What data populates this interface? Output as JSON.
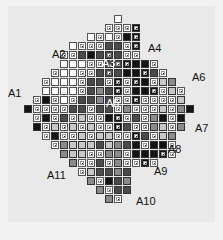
{
  "figure": {
    "background": "#e9e9e9",
    "cell_pitch": 9,
    "origin": {
      "x": 15,
      "y": 15
    },
    "colors": {
      "W": "#ffffff",
      "L": "#c8c8c8",
      "G": "#8a8a8a",
      "D": "#4a4a4a",
      "K": "#141414"
    },
    "legend_codes": {
      ".": "empty",
      "W": "white",
      "w": "white-with-marker",
      "L": "light-gray",
      "l": "light-gray-with-marker",
      "G": "gray",
      "g": "gray-with-marker",
      "D": "dark-gray",
      "d": "dark-gray-with-marker",
      "K": "black",
      "k": "black-with-marker"
    },
    "rows": [
      "...........W..........",
      "..........wwwk........",
      "........WwWwKk........",
      "......WwwwDDwk........",
      ".....wwDKDdDww........",
      ".....WWWwwDdkKKw......",
      "....wWWwwDdDKKkDw.....",
      "...wWWWwDDwkwkKwLG....",
      "...WWWWwDGDkwKKkwLw...",
      "..wKwWwDDGDwwkwwwwL...",
      ".KwwwwDDwDDwGwwwLwGK..",
      "..wKwDwLwwKkwDwGKwK...",
      "..KwLwLwLwwkDwwGLwG...",
      "...wKwwLwLLwwkDwLG....",
      "....wGLLLDLGDKwKKw....",
      ".....GLLwwGGwKKKkw....",
      "......GwwDwGwwkw......",
      ".......wLDDGD.........",
      "........GwKDG.........",
      ".........GwDD.........",
      "..........Gw.........."
    ],
    "labels": [
      {
        "id": "A1",
        "text": "A1",
        "x": 8,
        "y": 88
      },
      {
        "id": "A2",
        "text": "A2",
        "x": 52,
        "y": 49
      },
      {
        "id": "A3",
        "text": "A3",
        "x": 102,
        "y": 58
      },
      {
        "id": "A4",
        "text": "A4",
        "x": 148,
        "y": 43
      },
      {
        "id": "A5",
        "text": "A5",
        "x": 106,
        "y": 98
      },
      {
        "id": "A6",
        "text": "A6",
        "x": 192,
        "y": 72
      },
      {
        "id": "A7",
        "text": "A7",
        "x": 195,
        "y": 123
      },
      {
        "id": "A8",
        "text": "A8",
        "x": 168,
        "y": 144
      },
      {
        "id": "A9",
        "text": "A9",
        "x": 154,
        "y": 166
      },
      {
        "id": "A10",
        "text": "A10",
        "x": 136,
        "y": 196
      },
      {
        "id": "A11",
        "text": "A11",
        "x": 47,
        "y": 170
      }
    ]
  }
}
